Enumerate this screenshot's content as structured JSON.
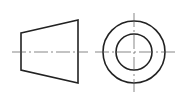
{
  "diagram": {
    "type": "projection-symbol",
    "colors": {
      "background": "#ffffff",
      "outline": "#222222",
      "centerline": "#555555"
    },
    "trapezoid_view": {
      "points": "21,33 78,20 78,83 21,70",
      "centerline": {
        "x1": 12,
        "y1": 52,
        "x2": 88,
        "y2": 52
      }
    },
    "circle_view": {
      "center": {
        "cx": 134,
        "cy": 52
      },
      "outer_radius": 31,
      "inner_radius": 18,
      "h_centerline": {
        "x1": 95,
        "y1": 52,
        "x2": 175,
        "y2": 52
      },
      "v_centerline": {
        "x1": 134,
        "y1": 13,
        "x2": 134,
        "y2": 92
      }
    }
  }
}
